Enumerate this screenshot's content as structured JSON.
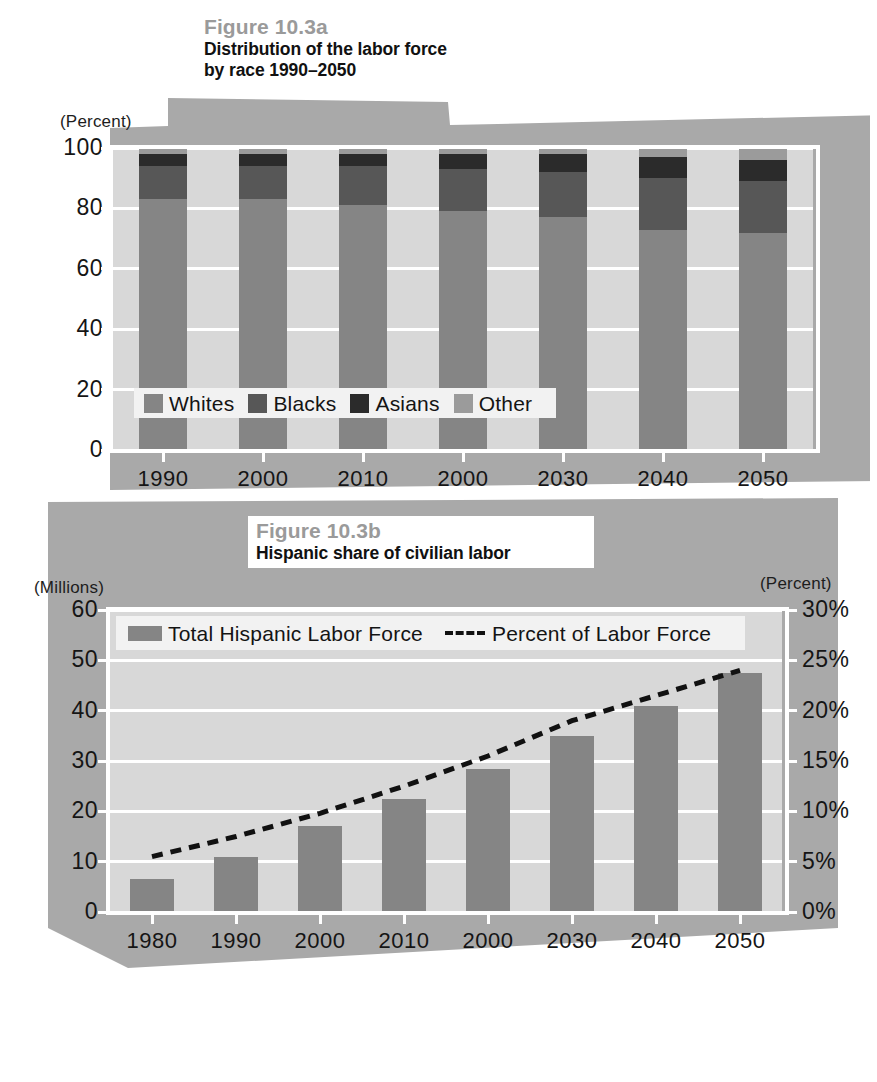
{
  "figure_a": {
    "fig_number": "Figure 10.3a",
    "fig_title_line1": "Distribution of the labor force",
    "fig_title_line2": "by race 1990–2050",
    "y_axis_caption": "(Percent)"
  },
  "figure_b": {
    "fig_number": "Figure 10.3b",
    "fig_title_line1": "Hispanic share of civilian labor",
    "y_axis_caption_left": "(Millions)",
    "y_axis_caption_right": "(Percent)"
  },
  "colors": {
    "paper_grey": "#a9a9a9",
    "plot_bg": "#d8d8d8",
    "grid_white": "#ffffff",
    "whites": "#858585",
    "blacks": "#575757",
    "asians": "#2b2b2b",
    "other": "#9b9b9b",
    "fig_number_grey": "#9a9a9a",
    "line_black": "#111111"
  },
  "chart_data": [
    {
      "type": "bar",
      "id": "figure-10-3a",
      "stacked": true,
      "percent_stacked": true,
      "title": "Distribution of the labor force by race 1990–2050",
      "subtitle": "Figure 10.3a",
      "xlabel": "",
      "ylabel": "(Percent)",
      "ylim": [
        0,
        100
      ],
      "yticks": [
        0,
        20,
        40,
        60,
        80,
        100
      ],
      "ytick_labels": [
        "0",
        "20",
        "40",
        "60",
        "80",
        "100"
      ],
      "grid": true,
      "legend": [
        "Whites",
        "Blacks",
        "Asians",
        "Other"
      ],
      "legend_position": "inside-lower-left",
      "categories": [
        "1990",
        "2000",
        "2010",
        "2000",
        "2030",
        "2040",
        "2050"
      ],
      "series": [
        {
          "name": "Whites",
          "color": "#858585",
          "values": [
            83,
            83,
            81,
            79,
            77,
            73,
            72
          ]
        },
        {
          "name": "Blacks",
          "color": "#575757",
          "values": [
            11,
            11,
            13,
            14,
            15,
            17,
            17
          ]
        },
        {
          "name": "Asians",
          "color": "#2b2b2b",
          "values": [
            4,
            4,
            4,
            5,
            6,
            7,
            7
          ]
        },
        {
          "name": "Other",
          "color": "#9b9b9b",
          "values": [
            2,
            2,
            2,
            2,
            2,
            3,
            4
          ]
        }
      ]
    },
    {
      "type": "bar",
      "id": "figure-10-3b",
      "combo": "bar+line",
      "title": "Hispanic share of civilian labor",
      "subtitle": "Figure 10.3b",
      "xlabel": "",
      "ylabel": "(Millions)",
      "y2label": "(Percent)",
      "ylim": [
        0,
        60
      ],
      "yticks": [
        0,
        10,
        20,
        30,
        40,
        50,
        60
      ],
      "ytick_labels": [
        "0",
        "10",
        "20",
        "30",
        "40",
        "50",
        "60"
      ],
      "y2lim": [
        0,
        30
      ],
      "y2ticks": [
        0,
        5,
        10,
        15,
        20,
        25,
        30
      ],
      "y2tick_labels": [
        "0%",
        "5%",
        "10%",
        "15%",
        "20%",
        "25%",
        "30%"
      ],
      "grid": true,
      "legend": [
        "Total Hispanic Labor Force",
        "Percent of Labor Force"
      ],
      "legend_position": "inside-top-left",
      "categories": [
        "1980",
        "1990",
        "2000",
        "2010",
        "2000",
        "2030",
        "2040",
        "2050"
      ],
      "series": [
        {
          "name": "Total Hispanic Labor Force",
          "type": "bar",
          "axis": "left",
          "color": "#858585",
          "values": [
            6.5,
            11.0,
            17.0,
            22.5,
            28.5,
            35.0,
            41.0,
            47.5
          ]
        },
        {
          "name": "Percent of Labor Force",
          "type": "line",
          "style": "dashed",
          "axis": "right",
          "color": "#111111",
          "values": [
            5.5,
            7.5,
            9.8,
            12.5,
            15.5,
            19.0,
            21.5,
            24.0
          ]
        }
      ]
    }
  ],
  "legend_a": [
    {
      "label": "Whites",
      "color": "#858585"
    },
    {
      "label": "Blacks",
      "color": "#575757"
    },
    {
      "label": "Asians",
      "color": "#2b2b2b"
    },
    {
      "label": "Other",
      "color": "#9b9b9b"
    }
  ],
  "legend_b": [
    {
      "label": "Total Hispanic Labor Force",
      "marker": "swatch",
      "color": "#858585"
    },
    {
      "label": "Percent of Labor Force",
      "marker": "dashed-line",
      "color": "#111111"
    }
  ]
}
